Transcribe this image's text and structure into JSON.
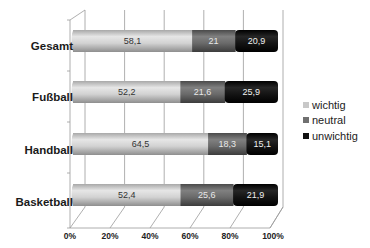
{
  "chart_data": {
    "type": "bar",
    "orientation": "horizontal",
    "stacked": "percent",
    "style": "3d-cylinder",
    "title": "",
    "xlabel": "",
    "ylabel": "",
    "categories": [
      "Gesamt",
      "Fußball",
      "Handball",
      "Basketball"
    ],
    "series": [
      {
        "name": "wichtig",
        "color": "#c8c8c8",
        "values": [
          58.1,
          52.2,
          64.5,
          52.4
        ],
        "labels": [
          "58,1",
          "52,2",
          "64,5",
          "52,4"
        ]
      },
      {
        "name": "neutral",
        "color": "#707070",
        "values": [
          21,
          21.6,
          18.3,
          25.6
        ],
        "labels": [
          "21",
          "21,6",
          "18,3",
          "25,6"
        ]
      },
      {
        "name": "unwichtig",
        "color": "#111111",
        "values": [
          20.9,
          25.9,
          15.1,
          21.9
        ],
        "labels": [
          "20,9",
          "25,9",
          "15,1",
          "21,9"
        ]
      }
    ],
    "x_ticks": [
      "0%",
      "20%",
      "40%",
      "60%",
      "80%",
      "100%"
    ],
    "xlim": [
      0,
      100
    ],
    "grid": true,
    "legend_position": "right"
  },
  "labels": {
    "categories": [
      "Gesamt",
      "Fußball",
      "Handball",
      "Basketball"
    ],
    "ticks": [
      "0%",
      "20%",
      "40%",
      "60%",
      "80%",
      "100%"
    ],
    "legend": [
      "wichtig",
      "neutral",
      "unwichtig"
    ]
  }
}
